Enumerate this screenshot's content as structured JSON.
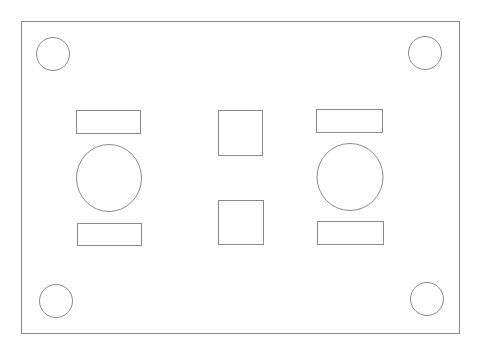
{
  "drawing": {
    "stroke_color": "#8a8a8a",
    "background": "#ffffff",
    "plate": {
      "x": 21,
      "y": 21,
      "width": 438,
      "height": 312
    },
    "corner_holes": [
      {
        "name": "top-left",
        "cx": 53,
        "cy": 54,
        "r": 16.5
      },
      {
        "name": "top-right",
        "cx": 425,
        "cy": 53,
        "r": 16.5
      },
      {
        "name": "bottom-left",
        "cx": 56,
        "cy": 301,
        "r": 16.5
      },
      {
        "name": "bottom-right",
        "cx": 427,
        "cy": 299,
        "r": 16.5
      }
    ],
    "large_holes": [
      {
        "name": "left",
        "cx": 109,
        "cy": 178,
        "rx": 32.5,
        "ry": 33.5
      },
      {
        "name": "right",
        "cx": 350,
        "cy": 177,
        "rx": 33,
        "ry": 33.5
      }
    ],
    "slots": [
      {
        "name": "left-top",
        "x": 76,
        "y": 110,
        "width": 64,
        "height": 23
      },
      {
        "name": "left-bottom",
        "x": 77,
        "y": 223,
        "width": 64,
        "height": 22
      },
      {
        "name": "right-top",
        "x": 316,
        "y": 109,
        "width": 66,
        "height": 23
      },
      {
        "name": "right-bottom",
        "x": 317,
        "y": 221,
        "width": 66,
        "height": 23
      }
    ],
    "square_cutouts": [
      {
        "name": "center-top",
        "x": 218,
        "y": 110,
        "width": 44,
        "height": 45
      },
      {
        "name": "center-bottom",
        "x": 218,
        "y": 200,
        "width": 45,
        "height": 44
      }
    ]
  }
}
